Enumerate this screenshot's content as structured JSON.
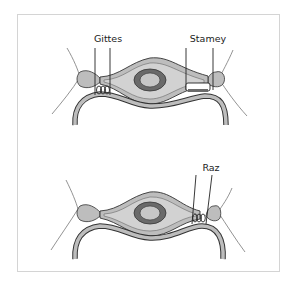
{
  "figure": {
    "panels": [
      {
        "id": "top",
        "labels": [
          {
            "text": "Gittes",
            "x": 108,
            "y": 42
          },
          {
            "text": "Stamey",
            "x": 208,
            "y": 42
          }
        ]
      },
      {
        "id": "bottom",
        "labels": [
          {
            "text": "Raz",
            "x": 211,
            "y": 171
          }
        ]
      }
    ],
    "colors": {
      "frame": "#d4d4d4",
      "tissue_fill": "#bdbdbd",
      "tissue_light": "#d2d2d2",
      "urethra_ring": "#6a6a6a",
      "outline": "#333333",
      "suture": "#222222"
    }
  }
}
